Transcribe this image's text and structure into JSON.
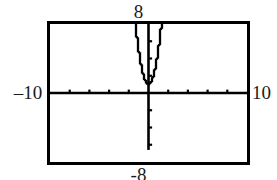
{
  "figure": {
    "title": "",
    "kind": "graphing-calculator-viewing-window"
  },
  "labels": {
    "ymax": "8",
    "ymin": "-8",
    "xmin": "–10",
    "xmax": "10"
  },
  "colors": {
    "frame": "#000000",
    "axis": "#000000",
    "curve": "#000000",
    "background": "#ffffff",
    "text": "#1a1a1a"
  },
  "chart_data": {
    "type": "line",
    "title": "",
    "xlabel": "",
    "ylabel": "",
    "xlim": [
      -10,
      10
    ],
    "ylim": [
      -8,
      8
    ],
    "grid": false,
    "legend": null,
    "xticks": [
      -10,
      -8,
      -6,
      -4,
      -2,
      0,
      2,
      4,
      6,
      8,
      10
    ],
    "yticks": [
      -8,
      -6,
      -4,
      -2,
      0,
      2,
      4,
      6,
      8
    ],
    "xtick_labels": [
      "",
      "",
      "",
      "",
      "",
      "",
      "",
      "",
      "",
      "",
      ""
    ],
    "ytick_labels": [
      "",
      "",
      "",
      "",
      "",
      "",
      "",
      "",
      ""
    ],
    "annotations": [
      {
        "text": "8",
        "position": "top-center-outside"
      },
      {
        "text": "-8",
        "position": "bottom-center-outside"
      },
      {
        "text": "-10",
        "position": "left-middle-outside"
      },
      {
        "text": "10",
        "position": "right-middle-outside"
      }
    ],
    "series": [
      {
        "name": "parabola",
        "kind": "parabola",
        "orientation": "opens-up",
        "vertex": [
          0,
          1
        ],
        "leading_coefficient": 4,
        "equation": "y = 4x^2 + 1",
        "x": [
          -1.35,
          -1.25,
          -1.15,
          -1.05,
          -0.95,
          -0.85,
          -0.75,
          -0.65,
          -0.55,
          -0.45,
          -0.35,
          -0.25,
          -0.15,
          -0.05,
          0.05,
          0.15,
          0.25,
          0.35,
          0.45,
          0.55,
          0.65,
          0.75,
          0.85,
          0.95,
          1.05,
          1.15,
          1.25,
          1.35
        ],
        "y": [
          8.29,
          7.25,
          6.29,
          5.41,
          4.61,
          3.89,
          3.25,
          2.69,
          2.21,
          1.81,
          1.49,
          1.25,
          1.09,
          1.01,
          1.01,
          1.09,
          1.25,
          1.49,
          1.81,
          2.21,
          2.69,
          3.25,
          3.89,
          4.61,
          5.41,
          6.29,
          7.25,
          8.29
        ]
      }
    ]
  }
}
